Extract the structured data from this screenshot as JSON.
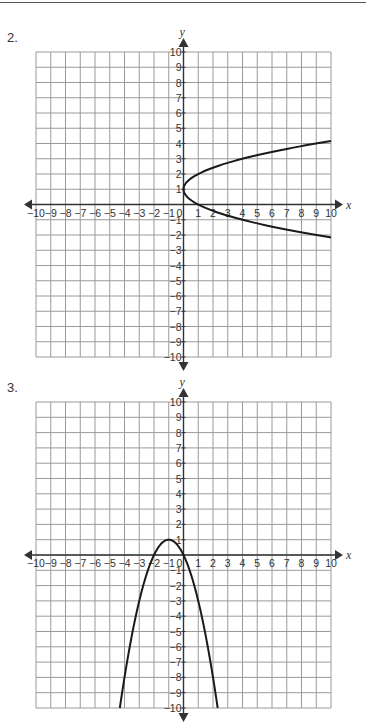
{
  "header": {
    "rule_color": "#555555"
  },
  "chart_data": [
    {
      "type": "line",
      "label": "2.",
      "title": "",
      "xlabel": "x",
      "ylabel": "y",
      "xlim": [
        -10,
        10
      ],
      "ylim": [
        -10,
        10
      ],
      "grid": true,
      "grid_step": 1,
      "x_ticks": [
        -10,
        -9,
        -8,
        -7,
        -6,
        -5,
        -4,
        -3,
        -2,
        -1,
        0,
        1,
        2,
        3,
        4,
        5,
        6,
        7,
        8,
        9,
        10
      ],
      "y_ticks": [
        -10,
        -9,
        -8,
        -7,
        -6,
        -5,
        -4,
        -3,
        -2,
        -1,
        1,
        2,
        3,
        4,
        5,
        6,
        7,
        8,
        9,
        10
      ],
      "series": [
        {
          "name": "curve",
          "equation": "x = (y - 1)^2",
          "orientation": "horizontal-parabola",
          "vertex": [
            0,
            1
          ],
          "points": [
            [
              10,
              4.16
            ],
            [
              9,
              4
            ],
            [
              4,
              3
            ],
            [
              1,
              2
            ],
            [
              0,
              1
            ],
            [
              1,
              0
            ],
            [
              4,
              -1
            ],
            [
              9,
              -2
            ],
            [
              10,
              -2.16
            ]
          ]
        }
      ]
    },
    {
      "type": "line",
      "label": "3.",
      "title": "",
      "xlabel": "x",
      "ylabel": "y",
      "xlim": [
        -10,
        10
      ],
      "ylim": [
        -10,
        10
      ],
      "grid": true,
      "grid_step": 1,
      "x_ticks": [
        -10,
        -9,
        -8,
        -7,
        -6,
        -5,
        -4,
        -3,
        -2,
        -1,
        0,
        1,
        2,
        3,
        4,
        5,
        6,
        7,
        8,
        9,
        10
      ],
      "y_ticks": [
        -10,
        -9,
        -8,
        -7,
        -6,
        -5,
        -4,
        -3,
        -2,
        -1,
        1,
        2,
        3,
        4,
        5,
        6,
        7,
        8,
        9,
        10
      ],
      "series": [
        {
          "name": "curve",
          "equation": "y = -(x + 1)^2 + 1",
          "orientation": "vertical-parabola-down",
          "vertex": [
            -1,
            1
          ],
          "points": [
            [
              -4.32,
              -10
            ],
            [
              -4,
              -8
            ],
            [
              -3,
              -3
            ],
            [
              -2,
              0
            ],
            [
              -1,
              1
            ],
            [
              0,
              0
            ],
            [
              1,
              -3
            ],
            [
              2,
              -8
            ],
            [
              2.32,
              -10
            ]
          ]
        }
      ]
    }
  ],
  "style": {
    "grid_color": "#9a9a9a",
    "axis_color": "#333333",
    "curve_color": "#1a1a1a"
  }
}
